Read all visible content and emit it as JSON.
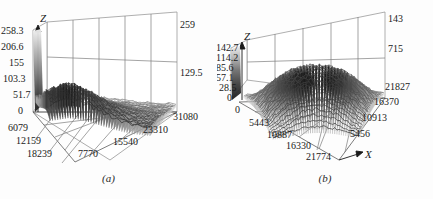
{
  "figure": {
    "title": "",
    "panels": [
      {
        "id": "a",
        "caption": "(a)",
        "z_axis_name": "Z",
        "x_axis_name": "",
        "z_ticks": [
          "0",
          "51.7",
          "103.3",
          "155",
          "206.6",
          "258.3"
        ],
        "left_floor_ticks": [
          "6079",
          "12159",
          "18239"
        ],
        "bottom_floor_ticks": [
          "7770",
          "15540",
          "23310",
          "31080"
        ],
        "right_wall_ticks": [
          "259",
          "129.5"
        ]
      },
      {
        "id": "b",
        "caption": "(b)",
        "z_axis_name": "Z",
        "x_axis_name": "X",
        "z_ticks": [
          "0",
          "28.5",
          "57.1",
          "85.6",
          "114.2",
          "142.7"
        ],
        "z_origin_tick": "0",
        "left_floor_ticks": [
          "5443",
          "10887",
          "16330",
          "21774"
        ],
        "right_floor_ticks": [
          "5456",
          "10913",
          "16370",
          "21827"
        ],
        "right_wall_ticks": [
          "143",
          "715"
        ]
      }
    ]
  },
  "chart_data": [
    {
      "type": "surface",
      "panel": "a",
      "title": "(a)",
      "xlabel": "",
      "ylabel": "",
      "zlabel": "Z",
      "zlim": [
        0,
        310
      ],
      "z_tick_values": [
        0,
        51.7,
        103.3,
        155,
        206.6,
        258.3
      ],
      "x_tick_values": [
        7770,
        15540,
        23310,
        31080
      ],
      "y_tick_values": [
        6079,
        12159,
        18239
      ],
      "back_wall_tick_values": [
        129.5,
        259
      ],
      "grid": true,
      "legend": "none",
      "colormap": "grayscale",
      "description": "Dense noisy grayscale mesh surface, high ridge along left/back edge decaying toward front-right plateau",
      "surface_profile": {
        "rows": 12,
        "cols": 12,
        "values": [
          [
            180,
            195,
            210,
            205,
            190,
            170,
            150,
            130,
            112,
            100,
            92,
            88
          ],
          [
            195,
            215,
            232,
            225,
            205,
            182,
            158,
            135,
            115,
            100,
            90,
            85
          ],
          [
            205,
            228,
            248,
            238,
            215,
            188,
            160,
            136,
            115,
            98,
            88,
            82
          ],
          [
            200,
            222,
            240,
            232,
            210,
            183,
            155,
            132,
            110,
            95,
            85,
            80
          ],
          [
            185,
            205,
            222,
            214,
            195,
            170,
            145,
            122,
            102,
            88,
            80,
            76
          ],
          [
            165,
            182,
            196,
            190,
            174,
            152,
            130,
            110,
            92,
            80,
            73,
            70
          ],
          [
            142,
            156,
            168,
            163,
            150,
            131,
            112,
            95,
            80,
            70,
            64,
            61
          ],
          [
            120,
            132,
            142,
            138,
            127,
            111,
            95,
            81,
            68,
            60,
            55,
            52
          ],
          [
            100,
            110,
            118,
            115,
            106,
            93,
            80,
            68,
            58,
            51,
            47,
            45
          ],
          [
            84,
            92,
            99,
            96,
            89,
            78,
            67,
            58,
            49,
            44,
            40,
            38
          ],
          [
            72,
            79,
            85,
            82,
            76,
            67,
            58,
            50,
            43,
            38,
            35,
            33
          ],
          [
            64,
            70,
            75,
            73,
            68,
            60,
            52,
            45,
            38,
            34,
            31,
            30
          ]
        ]
      }
    },
    {
      "type": "surface",
      "panel": "b",
      "title": "(b)",
      "xlabel": "X",
      "ylabel": "",
      "zlabel": "Z",
      "zlim": [
        0,
        171
      ],
      "z_tick_values": [
        0,
        28.5,
        57.1,
        85.6,
        114.2,
        142.7
      ],
      "x_tick_values": [
        5443,
        10887,
        16330,
        21774
      ],
      "y_tick_values": [
        5456,
        10913,
        16370,
        21827
      ],
      "back_wall_tick_values": [
        715,
        143
      ],
      "grid": true,
      "legend": "none",
      "colormap": "grayscale",
      "description": "Dense noisy grayscale mesh surface forming a broad raised dome/plateau in the center with low rims on all sides",
      "surface_profile": {
        "rows": 12,
        "cols": 12,
        "values": [
          [
            20,
            28,
            40,
            52,
            60,
            64,
            64,
            60,
            52,
            40,
            28,
            20
          ],
          [
            28,
            48,
            74,
            98,
            114,
            122,
            122,
            114,
            98,
            74,
            48,
            28
          ],
          [
            40,
            74,
            110,
            138,
            156,
            164,
            164,
            156,
            138,
            110,
            74,
            40
          ],
          [
            52,
            98,
            138,
            168,
            186,
            194,
            194,
            186,
            168,
            138,
            98,
            52
          ],
          [
            60,
            114,
            156,
            186,
            204,
            210,
            210,
            204,
            186,
            156,
            114,
            60
          ],
          [
            64,
            122,
            164,
            194,
            210,
            216,
            216,
            210,
            194,
            164,
            122,
            64
          ],
          [
            64,
            122,
            164,
            194,
            210,
            216,
            216,
            210,
            194,
            164,
            122,
            64
          ],
          [
            60,
            114,
            156,
            186,
            204,
            210,
            210,
            204,
            186,
            156,
            114,
            60
          ],
          [
            52,
            98,
            138,
            168,
            186,
            194,
            194,
            186,
            168,
            138,
            98,
            52
          ],
          [
            40,
            74,
            110,
            138,
            156,
            164,
            164,
            156,
            138,
            110,
            74,
            40
          ],
          [
            28,
            48,
            74,
            98,
            114,
            122,
            122,
            114,
            98,
            74,
            48,
            28
          ],
          [
            20,
            28,
            40,
            52,
            60,
            64,
            64,
            60,
            52,
            40,
            28,
            20
          ]
        ]
      }
    }
  ],
  "colors": {
    "background": "#fdfdfd",
    "grid": "#8a8a8a",
    "frame": "#5c5c5c",
    "text": "#1a1a1a",
    "surface_dark": "#2b2b2b",
    "surface_mid": "#6e6e6e",
    "surface_light": "#c9c9c9"
  }
}
